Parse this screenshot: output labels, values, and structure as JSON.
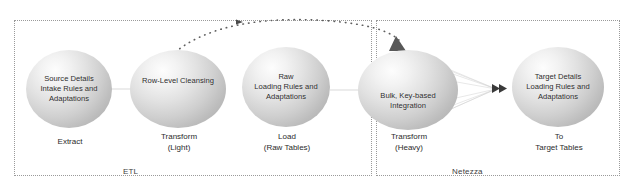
{
  "diagram": {
    "title_visible": false,
    "groups": [
      {
        "id": "etl",
        "label": "ETL"
      },
      {
        "id": "netezza",
        "label": "Netezza"
      }
    ],
    "nodes": [
      {
        "id": "source",
        "label": "Source Details\nIntake Rules and\nAdaptations",
        "caption": "Extract"
      },
      {
        "id": "cleanse",
        "label": "Row-Level Cleansing",
        "caption": "Transform\n(Light)"
      },
      {
        "id": "raw",
        "label": "Raw\nLoading Rules and\nAdaptations",
        "caption": "Load\n(Raw Tables)"
      },
      {
        "id": "bulk",
        "label": "Bulk, Key-based\nIntegration",
        "caption": "Transform\n(Heavy)"
      },
      {
        "id": "target",
        "label": "Target Details\nLoading Rules and\nAdaptations",
        "caption": "To\nTarget Tables"
      }
    ],
    "connectors": [
      {
        "id": "source-to-cleanse",
        "style": "fan-lines",
        "from": "source",
        "to": "cleanse"
      },
      {
        "id": "cleanse-to-raw",
        "style": "fan-lines",
        "from": "cleanse",
        "to": "raw"
      },
      {
        "id": "raw-to-bulk",
        "style": "fan-lines",
        "from": "raw",
        "to": "bulk"
      },
      {
        "id": "bulk-to-target",
        "style": "converging-fan-arrow",
        "from": "bulk",
        "to": "target"
      },
      {
        "id": "cleanse-to-bulk-dotted-arc",
        "style": "dotted-arc-arrow",
        "from": "cleanse",
        "to": "bulk"
      }
    ],
    "colors": {
      "background": "#ffffff",
      "group_border": "#9a9a9a",
      "node_fill_light": "#fdfdfd",
      "node_fill_dark": "#b2b2b2",
      "text": "#2b2b2b",
      "arrow": "#4a4a4a",
      "dotted_arc": "#6f6f6f"
    }
  }
}
